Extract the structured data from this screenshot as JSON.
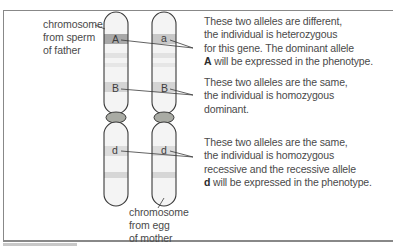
{
  "figure": {
    "type": "homologous chromosome pair with alleles",
    "chromosomes": [
      {
        "id": "paternal",
        "label_lines": [
          "chromosome",
          "from sperm",
          "of father"
        ],
        "alleles": [
          {
            "gene": "A",
            "symbol": "A"
          },
          {
            "gene": "B",
            "symbol": "B"
          },
          {
            "gene": "D",
            "symbol": "d"
          }
        ]
      },
      {
        "id": "maternal",
        "label_lines": [
          "chromosome",
          "from egg",
          "of mother"
        ],
        "alleles": [
          {
            "gene": "A",
            "symbol": "a"
          },
          {
            "gene": "B",
            "symbol": "B"
          },
          {
            "gene": "D",
            "symbol": "d"
          }
        ]
      }
    ],
    "annotations": [
      {
        "gene": "A",
        "lines": [
          "These two alleles are different,",
          "the individual is heterozygous",
          "for this gene. The dominant allele"
        ],
        "last_line_bold": "A",
        "last_line_rest": " will be expressed in the phenotype."
      },
      {
        "gene": "B",
        "lines": [
          "These two alleles are the same,",
          "the individual is homozygous",
          "dominant."
        ]
      },
      {
        "gene": "D",
        "lines": [
          "These two alleles are the same,",
          "the individual is homozygous",
          "recessive and the recessive allele"
        ],
        "last_line_bold": "d",
        "last_line_rest": " will be expressed in the phenotype."
      }
    ],
    "colors": {
      "chromosome_fill": "#f2f2f2",
      "chromosome_outline": "#3a3a3a",
      "band_dark": "#a8a8a8",
      "band_medium": "#d6d6d6",
      "band_light": "#e6e6e6",
      "centromere": "#a9aba4",
      "text": "#4a4a4a",
      "frame": "#888888"
    }
  }
}
